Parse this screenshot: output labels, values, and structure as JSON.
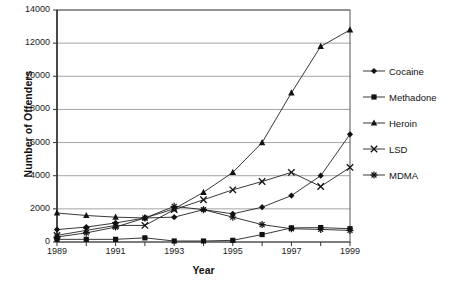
{
  "chart_data": {
    "type": "line",
    "title": "",
    "xlabel": "Year",
    "ylabel": "Number of Offenders",
    "x": [
      1989,
      1990,
      1991,
      1992,
      1993,
      1994,
      1995,
      1996,
      1997,
      1998,
      1999
    ],
    "xtick_labels": [
      "1989",
      "",
      "1991",
      "",
      "1993",
      "",
      "1995",
      "",
      "1997",
      "",
      "1999"
    ],
    "xtick_labels_shown": [
      "1989",
      "1991",
      "1993",
      "1995",
      "1997",
      "1999"
    ],
    "ytick_labels": [
      "0",
      "2000",
      "4000",
      "6000",
      "8000",
      "10000",
      "12000",
      "14000"
    ],
    "ylim": [
      0,
      14000
    ],
    "xlim": [
      1989,
      1999
    ],
    "ytick_step": 2000,
    "grid": "horizontal",
    "legend_position": "right",
    "series": [
      {
        "name": "Cocaine",
        "marker": "diamond",
        "color": "#222222",
        "values": [
          750,
          900,
          1150,
          1450,
          1500,
          1950,
          1700,
          2100,
          2800,
          4000,
          6500
        ]
      },
      {
        "name": "Methadone",
        "marker": "square",
        "color": "#222222",
        "values": [
          160,
          160,
          160,
          250,
          60,
          60,
          100,
          450,
          850,
          870,
          800
        ]
      },
      {
        "name": "Heroin",
        "marker": "triangle",
        "color": "#222222",
        "values": [
          1750,
          1600,
          1500,
          1450,
          2000,
          3000,
          4200,
          6000,
          9000,
          11800,
          12800
        ]
      },
      {
        "name": "LSD",
        "marker": "cross",
        "color": "#222222",
        "values": [
          400,
          700,
          1000,
          1000,
          1950,
          2550,
          3150,
          3650,
          4200,
          3350,
          4500
        ]
      },
      {
        "name": "MDMA",
        "marker": "asterisk",
        "color": "#222222",
        "values": [
          300,
          550,
          900,
          1450,
          2150,
          1950,
          1500,
          1050,
          800,
          760,
          700
        ]
      }
    ]
  },
  "legend": {
    "items": [
      {
        "label": "Cocaine"
      },
      {
        "label": "Methadone"
      },
      {
        "label": "Heroin"
      },
      {
        "label": "LSD"
      },
      {
        "label": "MDMA"
      }
    ]
  }
}
